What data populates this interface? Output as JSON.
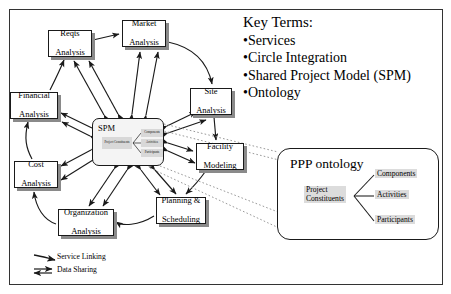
{
  "diagram": {
    "frame": {
      "x": 9,
      "y": 9,
      "w": 434,
      "h": 276
    }
  },
  "key_terms": {
    "heading": "Key Terms:",
    "items": [
      "Services",
      "Circle Integration",
      "Shared Project Model (SPM)",
      "Ontology"
    ],
    "bullet": "•"
  },
  "hub": {
    "label": "SPM",
    "x": 92,
    "y": 118,
    "w": 72,
    "h": 48,
    "mini_ontology": {
      "root": "Project Constituents",
      "children": [
        "Components",
        "Activities",
        "Participants"
      ]
    }
  },
  "nodes": [
    {
      "id": "reqts",
      "label": "Reqts\nAnalysis",
      "line1": "Reqts",
      "line2": "Analysis",
      "x": 48,
      "y": 30,
      "w": 44,
      "h": 27
    },
    {
      "id": "market",
      "label": "Market\nAnalysis",
      "line1": "Market",
      "line2": "Analysis",
      "x": 122,
      "y": 20,
      "w": 44,
      "h": 27
    },
    {
      "id": "site",
      "label": "Site\nAnalysis",
      "line1": "Site",
      "line2": "Analysis",
      "x": 190,
      "y": 88,
      "w": 42,
      "h": 27
    },
    {
      "id": "facility",
      "label": "Facility\nModeling",
      "line1": "Facility",
      "line2": "Modeling",
      "x": 196,
      "y": 143,
      "w": 48,
      "h": 27
    },
    {
      "id": "planning",
      "label": "Planning &\nScheduling",
      "line1": "Planning &",
      "line2": "Scheduling",
      "x": 156,
      "y": 197,
      "w": 50,
      "h": 27
    },
    {
      "id": "organization",
      "label": "Organization\nAnalysis",
      "line1": "Organization",
      "line2": "Analysis",
      "x": 58,
      "y": 209,
      "w": 56,
      "h": 27
    },
    {
      "id": "cost",
      "label": "Cost\nAnalysis",
      "line1": "Cost",
      "line2": "Analysis",
      "x": 14,
      "y": 161,
      "w": 44,
      "h": 27
    },
    {
      "id": "financial",
      "label": "Financial\nAnalysis",
      "line1": "Financial",
      "line2": "Analysis",
      "x": 10,
      "y": 92,
      "w": 48,
      "h": 27
    }
  ],
  "ppp_ontology": {
    "title": "PPP ontology",
    "root": "Project Constituents",
    "root_line1": "Project",
    "root_line2": "Constituents",
    "children": [
      "Components",
      "Activities",
      "Participants"
    ],
    "x": 277,
    "y": 148,
    "w": 162,
    "h": 92
  },
  "legend": {
    "items": [
      {
        "label": "Service Linking",
        "arrow": "single-curved-arrow"
      },
      {
        "label": "Data Sharing",
        "arrow": "double-headed-arrow"
      }
    ]
  },
  "colors": {
    "stroke": "#1a1a1a",
    "shadow": "#8a8a8a",
    "node_fill": "#ffffff",
    "hub_fill": "#f4f4f4",
    "label_fill": "#dcdcdc",
    "callout": "#9a9a9a"
  }
}
